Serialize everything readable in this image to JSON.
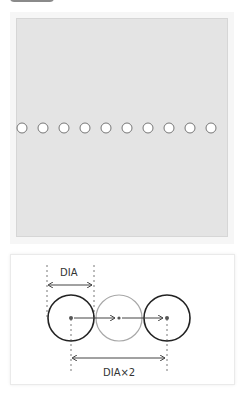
{
  "header": {
    "tab_color": "#8a8a8a"
  },
  "canvas": {
    "background": "#e4e4e4",
    "circle_count": 10,
    "circle_diameter_px": 10,
    "circle_spacing_px": 21,
    "circle_fill": "#ffffff",
    "circle_stroke": "#777777"
  },
  "diagram": {
    "top_label": "DIA",
    "bottom_label": "DIA×2",
    "circles": [
      {
        "name": "first",
        "stroke": "#222222"
      },
      {
        "name": "middle",
        "stroke": "#a8a8a8"
      },
      {
        "name": "last",
        "stroke": "#222222"
      }
    ]
  }
}
